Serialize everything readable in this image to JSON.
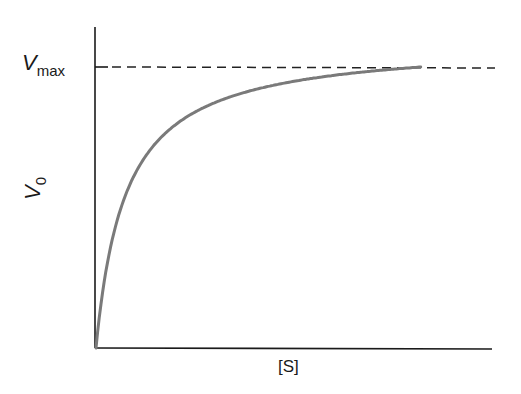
{
  "chart_data": {
    "type": "line",
    "title": "",
    "xlabel": "[S]",
    "ylabel": "V0",
    "ylabel_main": "V",
    "ylabel_sub": "0",
    "xlim": [
      0,
      1
    ],
    "ylim": [
      0,
      1.15
    ],
    "grid": false,
    "legend": null,
    "annotations": [
      {
        "type": "hline",
        "y": 1.0,
        "style": "dashed",
        "label": "Vmax",
        "label_main": "V",
        "label_sub": "max"
      }
    ],
    "series": [
      {
        "name": "Michaelis-Menten curve",
        "x": [
          0,
          0.02,
          0.05,
          0.1,
          0.15,
          0.2,
          0.3,
          0.4,
          0.5,
          0.6,
          0.7,
          0.8,
          0.82
        ],
        "y": [
          0,
          0.32,
          0.52,
          0.67,
          0.75,
          0.8,
          0.87,
          0.91,
          0.94,
          0.96,
          0.98,
          0.995,
          1.0
        ]
      }
    ],
    "colors": {
      "curve": "#7a7a7a",
      "axes": "#1a1a1a",
      "vmax_line": "#222222"
    }
  }
}
